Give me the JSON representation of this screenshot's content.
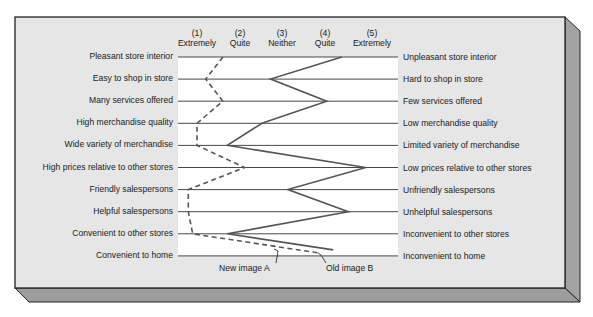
{
  "chart_data": {
    "type": "line",
    "title": "",
    "scale": {
      "points": [
        1,
        2,
        3,
        4,
        5
      ],
      "labels": [
        {
          "num": "(1)",
          "word": "Extremely"
        },
        {
          "num": "(2)",
          "word": "Quite"
        },
        {
          "num": "(3)",
          "word": "Neither"
        },
        {
          "num": "(4)",
          "word": "Quite"
        },
        {
          "num": "(5)",
          "word": "Extremely"
        }
      ]
    },
    "attributes": [
      {
        "left": "Pleasant store interior",
        "right": "Unpleasant store interior"
      },
      {
        "left": "Easy to shop in store",
        "right": "Hard to shop in store"
      },
      {
        "left": "Many services offered",
        "right": "Few services offered"
      },
      {
        "left": "High merchandise quality",
        "right": "Low merchandise quality"
      },
      {
        "left": "Wide variety of merchandise",
        "right": "Limited variety of merchandise"
      },
      {
        "left": "High prices relative to other stores",
        "right": "Low prices relative to other stores"
      },
      {
        "left": "Friendly salespersons",
        "right": "Unfriendly salespersons"
      },
      {
        "left": "Helpful salespersons",
        "right": "Unhelpful salespersons"
      },
      {
        "left": "Convenient to other stores",
        "right": "Inconvenient to other stores"
      },
      {
        "left": "Convenient to home",
        "right": "Inconvenient to home"
      }
    ],
    "series": [
      {
        "name": "New image A",
        "style": "dashed",
        "color": "#555555",
        "values": [
          1.6,
          1.2,
          1.6,
          1.0,
          1.0,
          2.1,
          0.8,
          0.8,
          0.9,
          3.8
        ]
      },
      {
        "name": "Old image B",
        "style": "solid",
        "color": "#555555",
        "values": [
          4.35,
          2.7,
          4.0,
          2.5,
          1.7,
          4.9,
          3.1,
          4.5,
          1.7,
          4.15
        ]
      }
    ],
    "xlabel": "",
    "ylabel": "",
    "xlim": [
      1,
      5
    ],
    "grid": true,
    "legend_position": "annotated-below"
  },
  "legend": {
    "series_a": "New image A",
    "series_b": "Old image B"
  },
  "colors": {
    "panel": "#e4e4e4",
    "plot_bg": "#ffffff",
    "bevel": "#9a9a9a",
    "line": "#555555",
    "rule": "#333333"
  }
}
